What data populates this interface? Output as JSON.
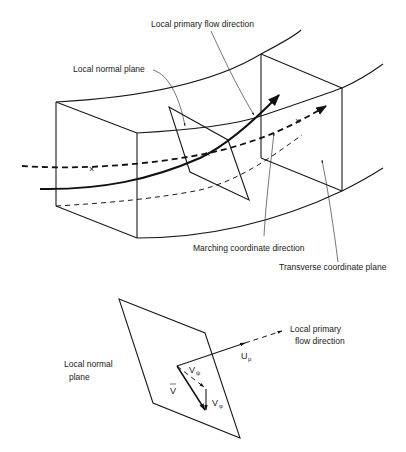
{
  "figure": {
    "upper": {
      "labels": {
        "primary_flow": "Local primary flow direction",
        "normal_plane": "Local normal plane",
        "marching": "Marching coordinate direction",
        "transverse": "Transverse coordinate plane"
      }
    },
    "lower": {
      "labels": {
        "normal_plane_line1": "Local normal",
        "normal_plane_line2": "plane",
        "primary_flow_line1": "Local primary",
        "primary_flow_line2": "flow direction",
        "up_main": "U",
        "up_sub": "p",
        "vpsi_main": "V",
        "vpsi_sub": "ψ",
        "vphi_main": "V",
        "vphi_sub": "φ",
        "vbar": "V",
        "vbar_bar": "_"
      }
    },
    "markers": {
      "cross": "×"
    }
  }
}
